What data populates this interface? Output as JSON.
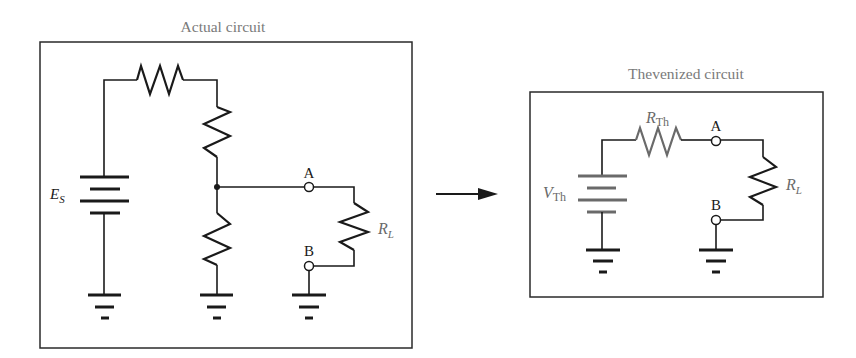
{
  "figure": {
    "left_panel": {
      "title": "Actual circuit",
      "source_label": {
        "main": "E",
        "sub": "S"
      },
      "load_label": {
        "main": "R",
        "sub": "L"
      },
      "terminal_a": "A",
      "terminal_b": "B",
      "components": [
        "voltage-source E_S",
        "series resistor (top)",
        "divider resistor (upper)",
        "divider resistor (lower)",
        "load resistor R_L",
        "3 ground symbols"
      ]
    },
    "arrow": {
      "direction": "right"
    },
    "right_panel": {
      "title": "Thevenized circuit",
      "source_label": {
        "main": "V",
        "sub": "Th"
      },
      "series_label": {
        "main": "R",
        "sub": "Th"
      },
      "load_label": {
        "main": "R",
        "sub": "L"
      },
      "terminal_a": "A",
      "terminal_b": "B",
      "components": [
        "voltage-source V_Th",
        "resistor R_Th",
        "load resistor R_L",
        "2 ground symbols"
      ]
    },
    "colors": {
      "ink": "#1a1a1a",
      "thevenin_gray": "#6a6a6a",
      "title_gray": "#7a7a7a",
      "background": "#ffffff"
    }
  }
}
